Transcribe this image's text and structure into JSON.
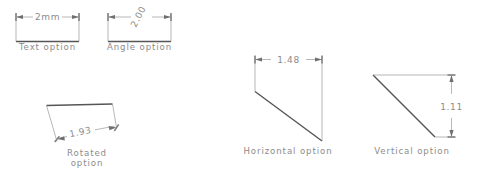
{
  "figure": {
    "background_color": "#ffffff",
    "line_color": "#9a9a9a",
    "object_color": "#6d6d6d",
    "text_color": "#8c8c8c"
  },
  "panels": [
    {
      "key": "text_option",
      "caption": "Text  option",
      "dimension_value": "2mm",
      "style": "horizontal-inline"
    },
    {
      "key": "angle_option",
      "caption": "Angle  option",
      "dimension_value": "2.00",
      "style": "rotated-text",
      "text_rotation_deg": -62
    },
    {
      "key": "rotated_option",
      "caption_line1": "Rotated",
      "caption_line2": "option",
      "dimension_value": "1.93",
      "style": "aligned-to-object",
      "text_rotation_deg": -12
    },
    {
      "key": "horizontal_option",
      "caption": "Horizontal  option",
      "dimension_value": "1.48",
      "style": "horizontal-projection"
    },
    {
      "key": "vertical_option",
      "caption": "Vertical  option",
      "dimension_value": "1.11",
      "style": "vertical-projection"
    }
  ]
}
